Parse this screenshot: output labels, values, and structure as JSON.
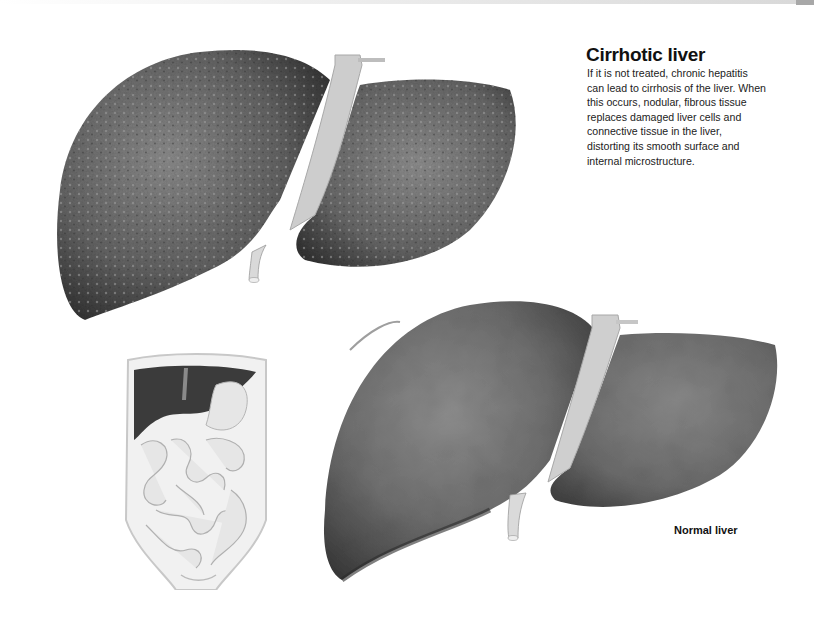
{
  "header": {
    "bar_color": "#d8d8d8",
    "tab_color": "#a8a8a8"
  },
  "cirrhotic": {
    "title": "Cirrhotic liver",
    "description": "If it is not treated, chronic hepatitis can lead to cirrhosis of the liver. When this occurs, nodular, fibrous tissue replaces damaged liver cells and  connective tissue in the liver, distorting its smooth surface and internal microstructure.",
    "illustration": "cirrhotic-liver-illustration"
  },
  "normal": {
    "caption": "Normal liver",
    "illustration": "normal-liver-illustration"
  },
  "torso": {
    "illustration": "abdomen-torso-illustration"
  },
  "colors": {
    "cirrhotic_fill": "#5e5e5e",
    "normal_fill": "#707070",
    "ligament": "#cfcfcf",
    "torso_liver": "#3a3a3a",
    "intestine": "#e4e4e4"
  }
}
